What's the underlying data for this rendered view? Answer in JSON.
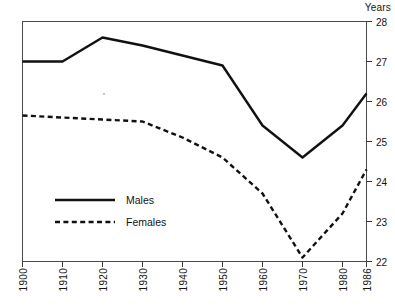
{
  "chart_data": {
    "type": "line",
    "title": "",
    "subtitle": "",
    "xlabel": "",
    "ylabel": "Years",
    "yunit_label": "Years",
    "x": [
      1900,
      1910,
      1920,
      1930,
      1940,
      1950,
      1960,
      1970,
      1980,
      1986
    ],
    "categories": [
      "1900",
      "1910",
      "1920",
      "1930",
      "1940",
      "1950",
      "1960",
      "1970",
      "1980",
      "1986"
    ],
    "xtick_labels": [
      "1900",
      "1910",
      "1920",
      "1930",
      "1940",
      "1950",
      "1960",
      "1970",
      "1980",
      "1986"
    ],
    "ytick_labels": [
      "28",
      "27",
      "26",
      "25",
      "24",
      "23",
      "22"
    ],
    "yticks": [
      28,
      27,
      26,
      25,
      24,
      23,
      22
    ],
    "ylim": [
      22,
      28
    ],
    "xlim": [
      1900,
      1986
    ],
    "grid": false,
    "legend_position": "inside-lower-left",
    "series": [
      {
        "name": "Males",
        "style": "solid",
        "color": "#111111",
        "values": [
          27.0,
          27.0,
          27.6,
          27.4,
          27.15,
          26.9,
          25.4,
          24.6,
          25.4,
          26.2
        ]
      },
      {
        "name": "Females",
        "style": "dashed",
        "color": "#111111",
        "values": [
          25.65,
          25.6,
          25.55,
          25.5,
          25.1,
          24.6,
          23.7,
          22.1,
          23.2,
          24.3
        ]
      }
    ],
    "annotations": []
  },
  "legend": {
    "entries": [
      {
        "label": "Males",
        "style": "solid"
      },
      {
        "label": "Females",
        "style": "dashed"
      }
    ]
  }
}
